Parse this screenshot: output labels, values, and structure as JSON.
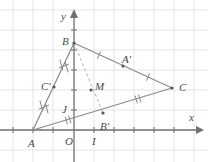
{
  "figure": {
    "background_color": "#ffffff",
    "grid_color": "#dfe6ec",
    "axis_color": "#6f6f6f",
    "segment_color": "#8a8a8a",
    "dashed_color": "#b0b0b0",
    "label_color": "#4a4a4a",
    "point_color": "#555555"
  },
  "axes": {
    "x_label": "x",
    "y_label": "y",
    "origin_label": "O",
    "unit_label": "I",
    "unit_y_label": "J",
    "x_axis_y": 130,
    "y_axis_x": 74,
    "grid_step": 20
  },
  "points": [
    {
      "name": "A",
      "label": "A",
      "x": 33,
      "y": 130,
      "lx": 28,
      "ly": 138,
      "dot": false
    },
    {
      "name": "B",
      "label": "B",
      "x": 74,
      "y": 43,
      "lx": 62,
      "ly": 36,
      "dot": true
    },
    {
      "name": "C",
      "label": "C",
      "x": 172,
      "y": 88,
      "lx": 179,
      "ly": 82,
      "dot": true
    },
    {
      "name": "A'",
      "label": "A'",
      "x": 123,
      "y": 66,
      "lx": 122,
      "ly": 54,
      "dot": true
    },
    {
      "name": "B'",
      "label": "B'",
      "x": 103,
      "y": 113,
      "lx": 100,
      "ly": 121,
      "dot": true
    },
    {
      "name": "C'",
      "label": "C'",
      "x": 54,
      "y": 87,
      "lx": 41,
      "ly": 81,
      "dot": true
    },
    {
      "name": "M",
      "label": "M",
      "x": 91,
      "y": 90,
      "lx": 95,
      "ly": 81,
      "dot": true
    }
  ],
  "segments": [
    {
      "name": "AB",
      "x1": 33,
      "y1": 130,
      "x2": 74,
      "y2": 43
    },
    {
      "name": "BC",
      "x1": 74,
      "y1": 43,
      "x2": 172,
      "y2": 88
    },
    {
      "name": "AC",
      "x1": 33,
      "y1": 130,
      "x2": 172,
      "y2": 88
    }
  ],
  "median": {
    "name": "BB'",
    "x1": 74,
    "y1": 43,
    "x2": 103,
    "y2": 113,
    "style": "dashed"
  },
  "tick_marks": [
    {
      "name": "AB-lower",
      "type": "double-cross",
      "x": 44,
      "y": 107,
      "angle": -64
    },
    {
      "name": "AB-upper",
      "type": "double-cross",
      "x": 64,
      "y": 66,
      "angle": -64
    },
    {
      "name": "BC-left",
      "type": "single",
      "x": 99,
      "y": 55,
      "angle": 24
    },
    {
      "name": "BC-right",
      "type": "single",
      "x": 148,
      "y": 77,
      "angle": 24
    },
    {
      "name": "AC-left",
      "type": "double-parallel",
      "x": 68,
      "y": 120,
      "angle": -17
    },
    {
      "name": "AC-right",
      "type": "double-parallel",
      "x": 138,
      "y": 99,
      "angle": -17
    }
  ],
  "x_ticks": [
    13,
    33,
    53,
    94,
    114,
    134,
    154,
    174
  ],
  "y_ticks": [
    110,
    90,
    70,
    50,
    30
  ],
  "grid_lines_v": [
    13,
    33,
    53,
    94,
    114,
    134,
    154,
    174,
    194
  ],
  "grid_lines_h": [
    10,
    30,
    50,
    70,
    90,
    110,
    150
  ]
}
